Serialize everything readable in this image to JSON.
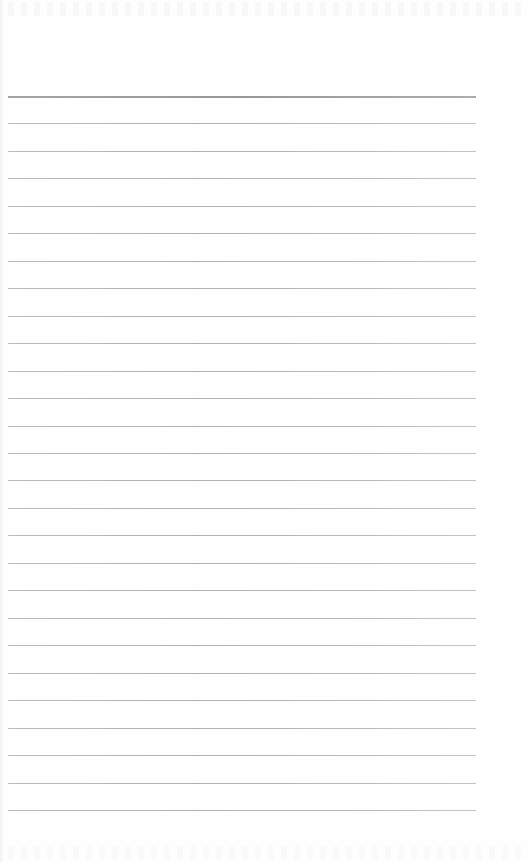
{
  "page": {
    "type": "lined-paper",
    "background_color": "#fefefe",
    "rule_color": "#b8b8b8",
    "first_rule_color": "#9c9c9c",
    "rule_count": 27,
    "first_rule_y": 96,
    "rule_spacing": 27.46,
    "rule_left": 8,
    "rule_width": 468,
    "text": ""
  }
}
